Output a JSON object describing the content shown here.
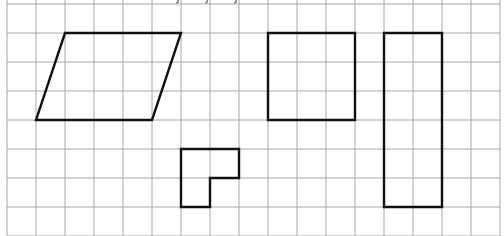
{
  "grid": {
    "origin_x": 7,
    "origin_y": 4,
    "cell": 29,
    "cols": 17,
    "rows": 8,
    "line_color": "#a8a8a8",
    "background": "#ffffff"
  },
  "shape_color": "#111111",
  "shapes": [
    {
      "name": "parallelogram",
      "points_grid": [
        [
          2,
          1
        ],
        [
          6,
          1
        ],
        [
          5,
          4
        ],
        [
          1,
          4
        ]
      ]
    },
    {
      "name": "l-shape",
      "points_grid": [
        [
          6,
          5
        ],
        [
          8,
          5
        ],
        [
          8,
          6
        ],
        [
          7,
          6
        ],
        [
          7,
          7
        ],
        [
          6,
          7
        ]
      ]
    },
    {
      "name": "square",
      "points_grid": [
        [
          9,
          1
        ],
        [
          12,
          1
        ],
        [
          12,
          4
        ],
        [
          9,
          4
        ]
      ]
    },
    {
      "name": "tall-rectangle",
      "points_grid": [
        [
          13,
          1
        ],
        [
          15,
          1
        ],
        [
          15,
          7
        ],
        [
          13,
          7
        ]
      ]
    }
  ]
}
